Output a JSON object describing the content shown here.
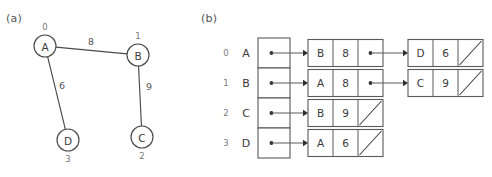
{
  "figure": {
    "panel_a_label": "(a)",
    "panel_b_label": "(b)"
  },
  "chart_data": {
    "type": "diagram",
    "title": "",
    "subtitle": "",
    "panels": [
      {
        "label": "(a)",
        "kind": "weighted-undirected-graph",
        "nodes": [
          {
            "id": "A",
            "index": "0",
            "cx": 45,
            "cy": 46,
            "r": 11,
            "index_pos": "above"
          },
          {
            "id": "B",
            "index": "1",
            "cx": 138,
            "cy": 55,
            "r": 11,
            "index_pos": "above"
          },
          {
            "id": "C",
            "index": "2",
            "cx": 142,
            "cy": 137,
            "r": 11,
            "index_pos": "below"
          },
          {
            "id": "D",
            "index": "3",
            "cx": 68,
            "cy": 140,
            "r": 11,
            "index_pos": "below"
          }
        ],
        "edges": [
          {
            "from": "A",
            "to": "B",
            "weight": "8",
            "label_x": 91,
            "label_y": 41
          },
          {
            "from": "A",
            "to": "D",
            "weight": "6",
            "label_x": 62,
            "label_y": 85
          },
          {
            "from": "B",
            "to": "C",
            "weight": "9",
            "label_x": 149,
            "label_y": 86
          }
        ]
      },
      {
        "label": "(b)",
        "kind": "adjacency-list",
        "array_header": "",
        "rows": [
          {
            "index": "0",
            "vertex": "A",
            "nodes": [
              {
                "vertex": "B",
                "weight": "8",
                "next": "pointer"
              },
              {
                "vertex": "D",
                "weight": "6",
                "next": "null"
              }
            ]
          },
          {
            "index": "1",
            "vertex": "B",
            "nodes": [
              {
                "vertex": "A",
                "weight": "8",
                "next": "pointer"
              },
              {
                "vertex": "C",
                "weight": "9",
                "next": "null"
              }
            ]
          },
          {
            "index": "2",
            "vertex": "C",
            "nodes": [
              {
                "vertex": "B",
                "weight": "9",
                "next": "null"
              }
            ]
          },
          {
            "index": "3",
            "vertex": "D",
            "nodes": [
              {
                "vertex": "A",
                "weight": "6",
                "next": "null"
              }
            ]
          }
        ]
      }
    ],
    "colors": {
      "background": "#ffffff",
      "stroke": "#4a4a4a",
      "box_stroke": "#5a5a5a",
      "text": "#3a3a3a",
      "muted_text": "#777777",
      "pointer": "#2e2e2e"
    }
  },
  "geometry": {
    "adjlist": {
      "index_x": 26,
      "vertex_x": 46,
      "array_left": 58,
      "array_width": 32,
      "row_top_0": 38,
      "row_height": 30,
      "node_cell_width": 25,
      "node_box_width_3": 75,
      "col1_left": 108,
      "col2_left": 208,
      "node_box_height": 27
    }
  }
}
